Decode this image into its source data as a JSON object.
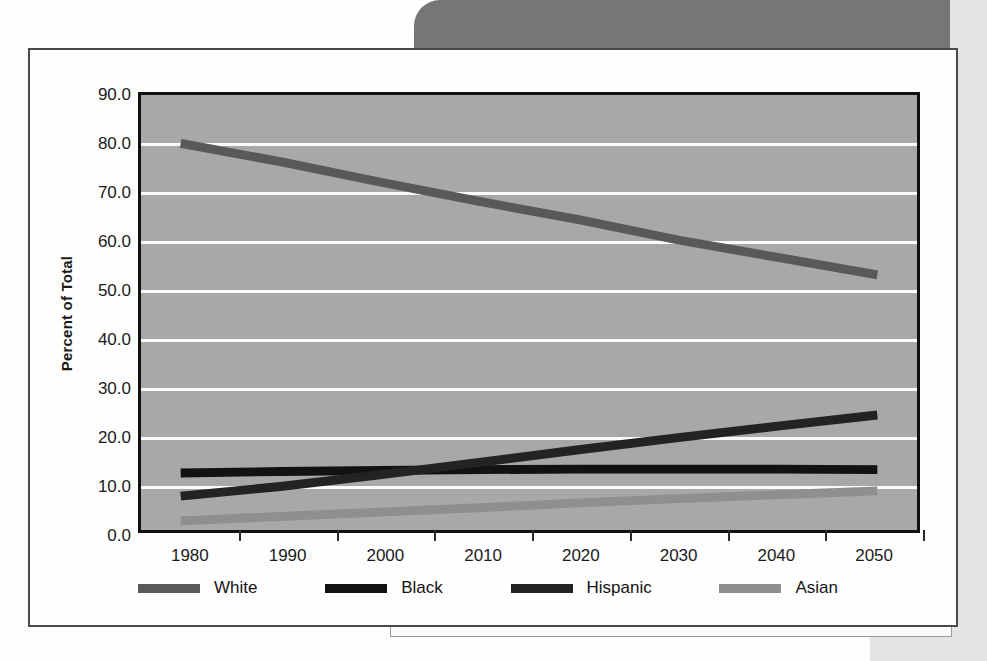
{
  "chart_data": {
    "type": "line",
    "title": "",
    "xlabel": "",
    "ylabel": "Percent of Total",
    "x": [
      1980,
      1990,
      2000,
      2010,
      2020,
      2030,
      2040,
      2050
    ],
    "xtick_labels": [
      "1980",
      "1990",
      "2000",
      "2010",
      "2020",
      "2030",
      "2040",
      "2050"
    ],
    "ytick_labels": [
      "0.0",
      "10.0",
      "20.0",
      "30.0",
      "40.0",
      "50.0",
      "60.0",
      "70.0",
      "80.0",
      "90.0"
    ],
    "ytick_values": [
      0,
      10,
      20,
      30,
      40,
      50,
      60,
      70,
      80,
      90
    ],
    "ylim": [
      0,
      90
    ],
    "xlim": [
      1980,
      2050
    ],
    "grid": true,
    "legend_position": "bottom",
    "series": [
      {
        "name": "White",
        "color": "#595959",
        "values": [
          80.0,
          76.2,
          72.0,
          68.0,
          64.2,
          60.0,
          56.4,
          52.8
        ]
      },
      {
        "name": "Black",
        "color": "#121212",
        "values": [
          11.8,
          12.1,
          12.3,
          12.5,
          12.6,
          12.6,
          12.6,
          12.5
        ]
      },
      {
        "name": "Hispanic",
        "color": "#232323",
        "values": [
          7.0,
          9.0,
          11.4,
          14.0,
          16.6,
          19.1,
          21.5,
          23.8
        ]
      },
      {
        "name": "Asian",
        "color": "#8f8f8f",
        "values": [
          1.9,
          2.8,
          3.7,
          4.6,
          5.6,
          6.5,
          7.3,
          8.1
        ]
      }
    ]
  },
  "figure": {
    "y_axis_title": "Percent of Total"
  }
}
